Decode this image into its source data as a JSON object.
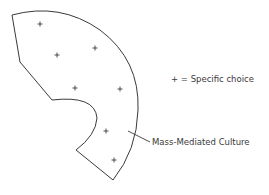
{
  "diagram": {
    "region_label": "Mass-Mediated Culture",
    "legend": {
      "symbol": "+",
      "text": "+ = Specific choice"
    },
    "marker_count": 7,
    "colors": {
      "stroke": "#3a3a3a",
      "background": "#ffffff"
    }
  }
}
